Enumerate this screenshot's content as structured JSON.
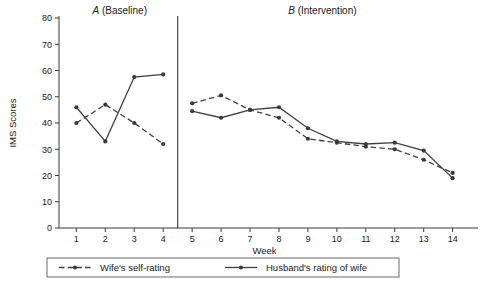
{
  "chart_data": {
    "type": "line",
    "title": "",
    "xlabel": "Week",
    "ylabel": "IMS Scores",
    "xlim": [
      0.4,
      14.6
    ],
    "ylim": [
      0,
      80
    ],
    "ytick_step": 10,
    "grid": false,
    "legend_position": "bottom",
    "x": [
      1,
      2,
      3,
      4,
      5,
      6,
      7,
      8,
      9,
      10,
      11,
      12,
      13,
      14
    ],
    "xticklabels": [
      "1",
      "2",
      "3",
      "4",
      "5",
      "6",
      "7",
      "8",
      "9",
      "10",
      "11",
      "12",
      "13",
      "14"
    ],
    "yticklabels": [
      "0",
      "10",
      "20",
      "30",
      "40",
      "50",
      "60",
      "70",
      "80"
    ],
    "yticks": [
      0,
      10,
      20,
      30,
      40,
      50,
      60,
      70,
      80
    ],
    "series": [
      {
        "name": "Wife's self-rating",
        "style": "dashed",
        "marker": "filled-circle",
        "color": "#3f3f3f",
        "values": [
          40,
          47,
          40,
          32,
          47.5,
          50.5,
          45,
          42,
          34,
          32.5,
          31,
          30,
          26,
          21
        ]
      },
      {
        "name": "Husband's rating of wife",
        "style": "solid",
        "marker": "filled-circle",
        "color": "#3f3f3f",
        "values": [
          46,
          33,
          57.5,
          58.5,
          44.5,
          42,
          45,
          46,
          38,
          33,
          32,
          32.5,
          29.5,
          19
        ]
      }
    ],
    "phases": [
      {
        "id": "A",
        "label": "(Baseline)",
        "letter": "A",
        "weeks": [
          1,
          4
        ]
      },
      {
        "id": "B",
        "label": "(Intervention)",
        "letter": "B",
        "weeks": [
          5,
          14
        ]
      }
    ],
    "phase_divider_x": 4.5,
    "annotations": []
  },
  "legend": {
    "entries": [
      {
        "label": "Wife's self-rating",
        "style": "dashed"
      },
      {
        "label": "Husband's rating of wife",
        "style": "solid"
      }
    ]
  }
}
